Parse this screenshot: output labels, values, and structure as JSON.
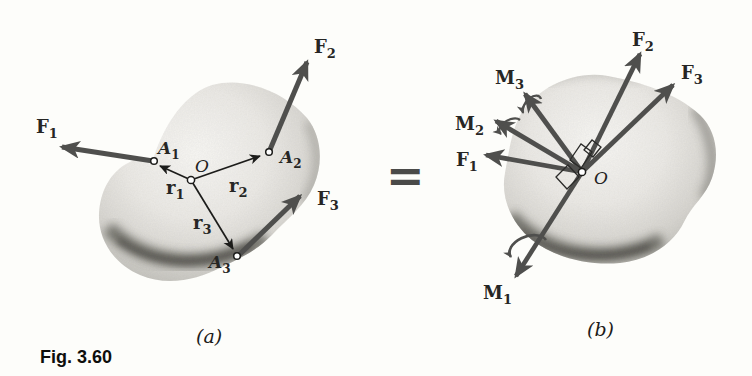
{
  "figure": {
    "caption": "Fig. 3.60",
    "equals_sign": "=",
    "panel_a": {
      "tag": "(a)",
      "origin_label": "O",
      "points": {
        "A1": {
          "main": "A",
          "sub": "1"
        },
        "A2": {
          "main": "A",
          "sub": "2"
        },
        "A3": {
          "main": "A",
          "sub": "3"
        }
      },
      "forces": {
        "F1": {
          "main": "F",
          "sub": "1"
        },
        "F2": {
          "main": "F",
          "sub": "2"
        },
        "F3": {
          "main": "F",
          "sub": "3"
        }
      },
      "position_vectors": {
        "r1": {
          "main": "r",
          "sub": "1"
        },
        "r2": {
          "main": "r",
          "sub": "2"
        },
        "r3": {
          "main": "r",
          "sub": "3"
        }
      }
    },
    "panel_b": {
      "tag": "(b)",
      "origin_label": "O",
      "forces": {
        "F1": {
          "main": "F",
          "sub": "1"
        },
        "F2": {
          "main": "F",
          "sub": "2"
        },
        "F3": {
          "main": "F",
          "sub": "3"
        }
      },
      "moments": {
        "M1": {
          "main": "M",
          "sub": "1"
        },
        "M2": {
          "main": "M",
          "sub": "2"
        },
        "M3": {
          "main": "M",
          "sub": "3"
        }
      }
    }
  },
  "colors": {
    "force_arrow": "#4f4f4d",
    "thin_vector": "#1c1c1a",
    "label_text": "#262624",
    "body_base": "#e9e8e4",
    "body_shadow": "#55544e",
    "background": "#fdfdfa"
  }
}
